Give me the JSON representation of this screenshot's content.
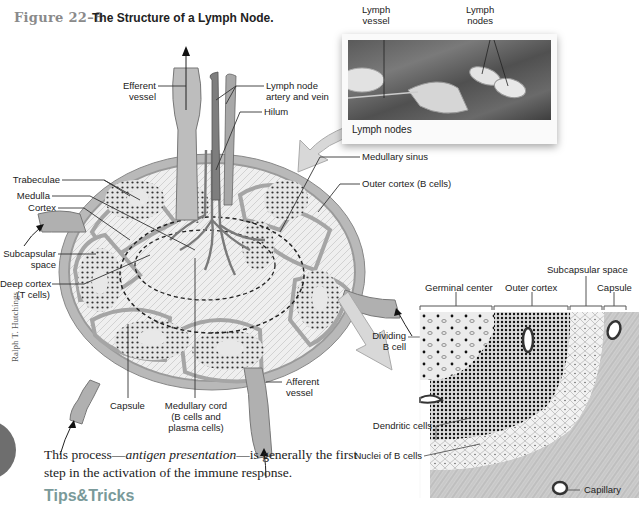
{
  "figure": {
    "number": "Figure 22–8",
    "title": "The Structure of a Lymph Node."
  },
  "photo_inset": {
    "caption": "Lymph nodes",
    "labels": {
      "lymph_vessel": [
        "Lymph",
        "vessel"
      ],
      "lymph_nodes": [
        "Lymph",
        "nodes"
      ]
    }
  },
  "main_diagram": {
    "labels": {
      "efferent_vessel": [
        "Efferent",
        "vessel"
      ],
      "artery_vein": [
        "Lymph node",
        "artery and vein"
      ],
      "hilum": "Hilum",
      "trabeculae": "Trabeculae",
      "medulla": "Medulla",
      "cortex": "Cortex",
      "subcapsular_space": [
        "Subcapsular",
        "space"
      ],
      "deep_cortex": [
        "Deep cortex",
        "(T cells)"
      ],
      "capsule": "Capsule",
      "medullary_cord": [
        "Medullary cord",
        "(B cells and",
        "plasma cells)"
      ],
      "afferent_vessel": [
        "Afferent",
        "vessel"
      ],
      "medullary_sinus": "Medullary sinus",
      "outer_cortex": "Outer cortex (B cells)"
    }
  },
  "detail_diagram": {
    "headers": {
      "germinal_center": "Germinal center",
      "outer_cortex": "Outer cortex",
      "subcapsular_space": "Subcapsular space",
      "capsule": "Capsule"
    },
    "labels": {
      "dividing_b_cell": [
        "Dividing",
        "B cell"
      ],
      "dendritic_cells": "Dendritic cells",
      "nuclei_b_cells": "Nuclei of B cells",
      "capillary": "Capillary"
    }
  },
  "credit": "Ralph T. Hutchings",
  "body": {
    "text_before": "This process—",
    "text_italic": "antigen presentation",
    "text_after": "—is generally the first step in the activation of the immune response."
  },
  "tips_heading": "Tips&Tricks"
}
